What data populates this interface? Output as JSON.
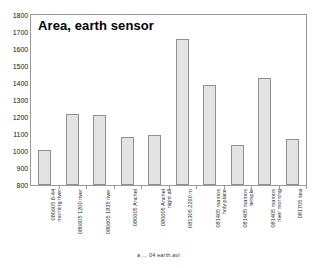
{
  "chart_data": {
    "type": "bar",
    "title": "Area, earth sensor",
    "xlabel": "",
    "ylabel": "",
    "ylim": [
      800,
      1800
    ],
    "ytick_step": 100,
    "yticks": [
      1800,
      1700,
      1600,
      1500,
      1400,
      1300,
      1200,
      1100,
      1000,
      900,
      800
    ],
    "grid": false,
    "legend": "none",
    "bar_fill_color": "#e3e3e3",
    "bar_border_color": "#8f8f8f",
    "categories": [
      "080605 8-44 morning river",
      "080605 1200 river",
      "080605 1835 river",
      "080605 Anchel",
      "080605 Anchel night all",
      "081305  2260 m",
      "081405 mamos holy place",
      "081405 mamos temple",
      "081405 mamos river morning",
      "081705 sea"
    ],
    "category_lines": [
      [
        "080605 8-44",
        "morning river"
      ],
      [
        "080605 1200 river",
        ""
      ],
      [
        "080605 1835 river",
        ""
      ],
      [
        "080605 Anchel",
        ""
      ],
      [
        "080605 Anchel",
        "night all"
      ],
      [
        "081305  2260 m",
        ""
      ],
      [
        "081405 mamos",
        "holy place"
      ],
      [
        "081405 mamos",
        "temple"
      ],
      [
        "081405 mamos",
        "river morning"
      ],
      [
        "081705 sea",
        ""
      ]
    ],
    "values": [
      1005,
      1215,
      1210,
      1082,
      1092,
      1660,
      1388,
      1035,
      1428,
      1068
    ]
  },
  "footer": {
    "caption": "a ... 04 earth.avi"
  }
}
